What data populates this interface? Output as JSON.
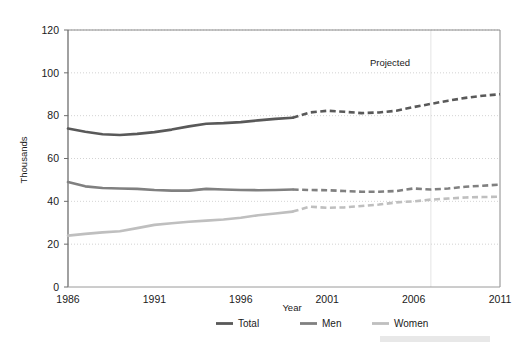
{
  "chart_data": {
    "type": "line",
    "title": "",
    "subtitle": "",
    "xlabel": "Year",
    "ylabel": "Thousands",
    "xlim": [
      1986,
      2011
    ],
    "ylim": [
      0,
      120
    ],
    "grid": true,
    "grid_axis": "y",
    "legend_position": "bottom-center",
    "x": [
      1986,
      1987,
      1988,
      1989,
      1990,
      1991,
      1992,
      1993,
      1994,
      1995,
      1996,
      1997,
      1998,
      1999,
      2000,
      2001,
      2002,
      2003,
      2004,
      2005,
      2006,
      2007,
      2008,
      2009,
      2010,
      2011
    ],
    "xticks": [
      1986,
      1991,
      1996,
      2001,
      2006,
      2011
    ],
    "xtick_labels": [
      "1986",
      "1991",
      "1996",
      "2001",
      "2006",
      "2011"
    ],
    "yticks": [
      0,
      20,
      40,
      60,
      80,
      100,
      120
    ],
    "ytick_labels": [
      "0",
      "20",
      "40",
      "60",
      "80",
      "100",
      "120"
    ],
    "projection_start_year": 1999,
    "series": [
      {
        "name": "Total",
        "color": "#595959",
        "values": [
          74.0,
          72.5,
          71.3,
          71.0,
          71.5,
          72.3,
          73.5,
          75.0,
          76.2,
          76.5,
          77.0,
          77.8,
          78.5,
          79.0,
          81.5,
          82.3,
          81.8,
          81.2,
          81.5,
          82.3,
          84.0,
          85.5,
          87.0,
          88.3,
          89.3,
          90.0
        ]
      },
      {
        "name": "Men",
        "color": "#808080",
        "values": [
          49.0,
          47.0,
          46.2,
          46.0,
          45.8,
          45.3,
          45.0,
          45.0,
          45.8,
          45.5,
          45.3,
          45.2,
          45.3,
          45.5,
          45.3,
          45.2,
          44.8,
          44.5,
          44.5,
          44.8,
          46.0,
          45.5,
          46.0,
          46.8,
          47.3,
          47.8
        ]
      },
      {
        "name": "Women",
        "color": "#bfbfbf",
        "values": [
          24.0,
          24.8,
          25.5,
          26.0,
          27.5,
          29.0,
          29.8,
          30.5,
          31.0,
          31.5,
          32.3,
          33.5,
          34.3,
          35.2,
          37.5,
          37.0,
          37.2,
          37.8,
          38.5,
          39.5,
          40.0,
          40.8,
          41.3,
          41.8,
          42.0,
          42.2
        ]
      }
    ],
    "annotations": [
      {
        "name": "projected-label",
        "text": "Projected",
        "x": 2004.0,
        "y": 106.5
      }
    ],
    "vertical_divider": {
      "name": "projection-divider",
      "x": 2007.0,
      "color": "#dcdcdc"
    },
    "legend": [
      {
        "label": "Total",
        "color": "#595959"
      },
      {
        "label": "Men",
        "color": "#808080"
      },
      {
        "label": "Women",
        "color": "#bfbfbf"
      }
    ]
  },
  "colors": {
    "total": "#595959",
    "men": "#808080",
    "women": "#bfbfbf",
    "grid": "#c8c8c8",
    "axis": "#6e6e6e",
    "text": "#1a1a1a",
    "background": "#ffffff"
  }
}
